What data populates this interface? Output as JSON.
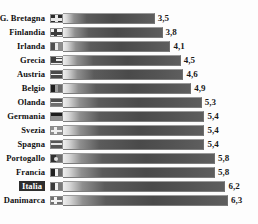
{
  "chart_data": {
    "type": "bar",
    "orientation": "horizontal",
    "title": "",
    "subtitle": "",
    "xlabel": "",
    "ylabel": "",
    "grid": false,
    "legend": null,
    "xlim": [
      0,
      6.3
    ],
    "categories": [
      "G. Bretagna",
      "Finlandia",
      "Irlanda",
      "Grecia",
      "Austria",
      "Belgio",
      "Olanda",
      "Germania",
      "Svezia",
      "Spagna",
      "Portogallo",
      "Francia",
      "Italia",
      "Danimarca"
    ],
    "values": [
      3.5,
      3.8,
      4.1,
      4.5,
      4.6,
      4.9,
      5.3,
      5.4,
      5.4,
      5.4,
      5.8,
      5.8,
      6.2,
      6.3
    ],
    "value_labels": [
      "3,5",
      "3,8",
      "4,1",
      "4,5",
      "4,6",
      "4,9",
      "5,3",
      "5,4",
      "5,4",
      "5,4",
      "5,8",
      "5,8",
      "6,2",
      "6,3"
    ],
    "highlighted_category": "Italia",
    "decimal_separator": ","
  },
  "rows": [
    {
      "label": "G. Bretagna",
      "value_label": "3,5",
      "value": 3.5,
      "flag_name": "flag-icon-united-kingdom",
      "highlight": false
    },
    {
      "label": "Finlandia",
      "value_label": "3,8",
      "value": 3.8,
      "flag_name": "flag-icon-finland",
      "highlight": false
    },
    {
      "label": "Irlanda",
      "value_label": "4,1",
      "value": 4.1,
      "flag_name": "flag-icon-ireland",
      "highlight": false
    },
    {
      "label": "Grecia",
      "value_label": "4,5",
      "value": 4.5,
      "flag_name": "flag-icon-greece",
      "highlight": false
    },
    {
      "label": "Austria",
      "value_label": "4,6",
      "value": 4.6,
      "flag_name": "flag-icon-austria",
      "highlight": false
    },
    {
      "label": "Belgio",
      "value_label": "4,9",
      "value": 4.9,
      "flag_name": "flag-icon-belgium",
      "highlight": false
    },
    {
      "label": "Olanda",
      "value_label": "5,3",
      "value": 5.3,
      "flag_name": "flag-icon-netherlands",
      "highlight": false
    },
    {
      "label": "Germania",
      "value_label": "5,4",
      "value": 5.4,
      "flag_name": "flag-icon-germany",
      "highlight": false
    },
    {
      "label": "Svezia",
      "value_label": "5,4",
      "value": 5.4,
      "flag_name": "flag-icon-sweden",
      "highlight": false
    },
    {
      "label": "Spagna",
      "value_label": "5,4",
      "value": 5.4,
      "flag_name": "flag-icon-spain",
      "highlight": false
    },
    {
      "label": "Portogallo",
      "value_label": "5,8",
      "value": 5.8,
      "flag_name": "flag-icon-portugal",
      "highlight": false
    },
    {
      "label": "Francia",
      "value_label": "5,8",
      "value": 5.8,
      "flag_name": "flag-icon-france",
      "highlight": false
    },
    {
      "label": "Italia",
      "value_label": "6,2",
      "value": 6.2,
      "flag_name": "flag-icon-italy",
      "highlight": true
    },
    {
      "label": "Danimarca",
      "value_label": "6,3",
      "value": 6.3,
      "flag_name": "flag-icon-denmark",
      "highlight": false
    }
  ],
  "colors": {
    "background": "#fdfdfd",
    "bar_dark": "#4a4a4a",
    "bar_light": "#efefef",
    "label_text": "#111111",
    "highlight_background": "#2e2e2e",
    "highlight_text": "#ffffff"
  },
  "layout": {
    "max_bar_px": 165,
    "max_value": 6.3
  }
}
